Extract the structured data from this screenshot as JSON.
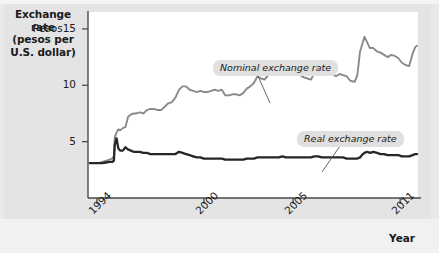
{
  "figure": {
    "axis_title_line1": "Exchange rate",
    "axis_title_line2": "(pesos per",
    "axis_title_line3": "U.S. dollar)",
    "x_axis_name": "Year"
  },
  "colors": {
    "nominal_line": "#8a8a8a",
    "real_line": "#262626",
    "panel_bg": "#e4e4e4",
    "plot_bg": "#ffffff",
    "axis": "#4a4a4a",
    "callout_bg": "#e0e0e0",
    "text": "#1a1a1a"
  },
  "chart_data": {
    "type": "line",
    "title": "",
    "xlabel": "Year",
    "ylabel": "Exchange rate (pesos per U.S. dollar)",
    "grid": false,
    "legend_position": "inline-annotations",
    "xlim": [
      1993.5,
      2012.0
    ],
    "ylim": [
      0,
      16.5
    ],
    "xticks": [
      1994,
      2000,
      2005,
      2011
    ],
    "xtick_labels": [
      "1994",
      "2000",
      "2005",
      "2011"
    ],
    "yticks": [
      5,
      10,
      15
    ],
    "ytick_labels": [
      "5",
      "10",
      "Pesos15"
    ],
    "annotations": [
      {
        "text": "Nominal exchange rate",
        "series": "Nominal exchange rate"
      },
      {
        "text": "Real exchange rate",
        "series": "Real exchange rate"
      }
    ],
    "series": [
      {
        "name": "Nominal exchange rate",
        "color": "#8a8a8a",
        "x": [
          1993.6,
          1993.9,
          1994.1,
          1994.3,
          1994.5,
          1994.7,
          1994.85,
          1994.95,
          1995.0,
          1995.1,
          1995.2,
          1995.3,
          1995.45,
          1995.6,
          1995.75,
          1995.9,
          1996.05,
          1996.2,
          1996.4,
          1996.6,
          1996.8,
          1997.0,
          1997.2,
          1997.4,
          1997.6,
          1997.8,
          1998.0,
          1998.2,
          1998.4,
          1998.6,
          1998.8,
          1999.0,
          1999.2,
          1999.4,
          1999.6,
          1999.8,
          2000.0,
          2000.2,
          2000.4,
          2000.6,
          2000.8,
          2001.0,
          2001.2,
          2001.4,
          2001.6,
          2001.8,
          2002.0,
          2002.2,
          2002.4,
          2002.6,
          2002.8,
          2003.0,
          2003.2,
          2003.4,
          2003.6,
          2003.8,
          2004.0,
          2004.2,
          2004.4,
          2004.6,
          2004.8,
          2005.0,
          2005.2,
          2005.4,
          2005.6,
          2005.8,
          2006.0,
          2006.2,
          2006.4,
          2006.6,
          2006.8,
          2007.0,
          2007.2,
          2007.4,
          2007.6,
          2007.8,
          2008.0,
          2008.2,
          2008.45,
          2008.6,
          2008.75,
          2008.85,
          2009.0,
          2009.15,
          2009.3,
          2009.5,
          2009.7,
          2009.9,
          2010.1,
          2010.3,
          2010.5,
          2010.7,
          2010.9,
          2011.1,
          2011.3,
          2011.5,
          2011.7,
          2011.85,
          2011.95
        ],
        "y": [
          3.1,
          3.1,
          3.1,
          3.2,
          3.3,
          3.4,
          3.5,
          3.7,
          5.4,
          5.8,
          6.1,
          6.0,
          6.2,
          6.3,
          7.2,
          7.4,
          7.5,
          7.5,
          7.6,
          7.5,
          7.8,
          7.9,
          7.9,
          7.8,
          7.8,
          8.1,
          8.4,
          8.5,
          8.9,
          9.6,
          9.9,
          9.9,
          9.6,
          9.5,
          9.4,
          9.5,
          9.4,
          9.4,
          9.5,
          9.6,
          9.5,
          9.6,
          9.1,
          9.1,
          9.2,
          9.2,
          9.1,
          9.3,
          9.7,
          9.9,
          10.2,
          10.8,
          10.6,
          10.5,
          10.9,
          11.2,
          11.3,
          11.4,
          11.5,
          11.4,
          11.3,
          11.2,
          11.0,
          10.9,
          10.7,
          10.6,
          10.5,
          11.1,
          11.3,
          10.9,
          10.9,
          11.0,
          11.0,
          10.8,
          11.0,
          10.9,
          10.8,
          10.4,
          10.3,
          10.9,
          13.0,
          13.5,
          14.3,
          13.8,
          13.3,
          13.3,
          13.0,
          12.9,
          12.7,
          12.5,
          12.7,
          12.6,
          12.4,
          12.0,
          11.8,
          11.7,
          12.8,
          13.4,
          13.5
        ]
      },
      {
        "name": "Real exchange rate",
        "color": "#262626",
        "x": [
          1993.6,
          1993.9,
          1994.1,
          1994.3,
          1994.5,
          1994.7,
          1994.85,
          1994.95,
          1995.0,
          1995.1,
          1995.2,
          1995.3,
          1995.45,
          1995.6,
          1995.75,
          1995.9,
          1996.05,
          1996.2,
          1996.4,
          1996.6,
          1996.8,
          1997.0,
          1997.2,
          1997.4,
          1997.6,
          1997.8,
          1998.0,
          1998.2,
          1998.4,
          1998.6,
          1998.8,
          1999.0,
          1999.2,
          1999.4,
          1999.6,
          1999.8,
          2000.0,
          2000.2,
          2000.4,
          2000.6,
          2000.8,
          2001.0,
          2001.2,
          2001.4,
          2001.6,
          2001.8,
          2002.0,
          2002.2,
          2002.4,
          2002.6,
          2002.8,
          2003.0,
          2003.2,
          2003.4,
          2003.6,
          2003.8,
          2004.0,
          2004.2,
          2004.4,
          2004.6,
          2004.8,
          2005.0,
          2005.2,
          2005.4,
          2005.6,
          2005.8,
          2006.0,
          2006.2,
          2006.4,
          2006.6,
          2006.8,
          2007.0,
          2007.2,
          2007.4,
          2007.6,
          2007.8,
          2008.0,
          2008.2,
          2008.45,
          2008.6,
          2008.75,
          2008.85,
          2009.0,
          2009.15,
          2009.3,
          2009.5,
          2009.7,
          2009.9,
          2010.1,
          2010.3,
          2010.5,
          2010.7,
          2010.9,
          2011.1,
          2011.3,
          2011.5,
          2011.7,
          2011.85,
          2011.95
        ],
        "y": [
          3.1,
          3.1,
          3.1,
          3.1,
          3.15,
          3.2,
          3.2,
          3.3,
          4.7,
          5.3,
          4.4,
          4.2,
          4.2,
          4.5,
          4.3,
          4.2,
          4.1,
          4.1,
          4.1,
          4.0,
          4.0,
          3.9,
          3.9,
          3.9,
          3.9,
          3.9,
          3.9,
          3.9,
          3.9,
          4.1,
          4.0,
          3.9,
          3.8,
          3.7,
          3.6,
          3.6,
          3.5,
          3.5,
          3.5,
          3.5,
          3.5,
          3.5,
          3.4,
          3.4,
          3.4,
          3.4,
          3.4,
          3.4,
          3.5,
          3.5,
          3.5,
          3.6,
          3.6,
          3.6,
          3.6,
          3.6,
          3.6,
          3.6,
          3.7,
          3.6,
          3.6,
          3.6,
          3.6,
          3.6,
          3.6,
          3.6,
          3.6,
          3.7,
          3.7,
          3.6,
          3.6,
          3.6,
          3.6,
          3.6,
          3.6,
          3.6,
          3.5,
          3.5,
          3.5,
          3.5,
          3.6,
          3.8,
          4.0,
          4.1,
          4.0,
          4.1,
          4.0,
          3.9,
          3.9,
          3.8,
          3.8,
          3.8,
          3.8,
          3.7,
          3.7,
          3.7,
          3.8,
          3.9,
          3.9
        ]
      }
    ]
  }
}
